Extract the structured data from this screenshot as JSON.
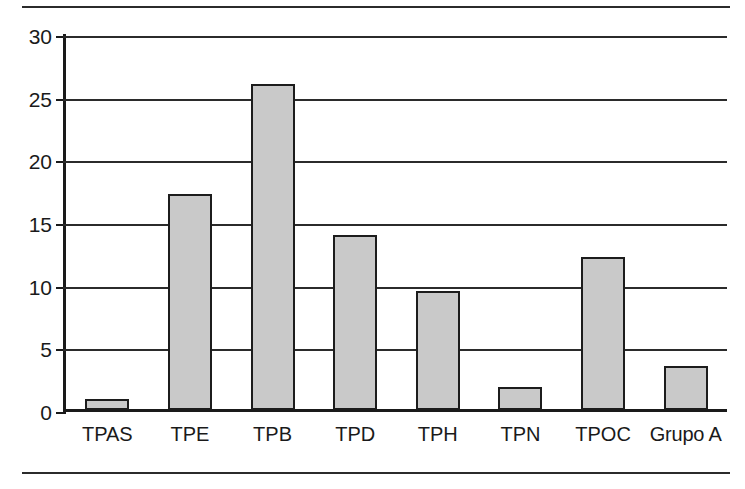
{
  "chart_data": {
    "type": "bar",
    "title": "",
    "subtitle": "",
    "xlabel": "",
    "ylabel": "",
    "categories": [
      "TPAS",
      "TPE",
      "TPB",
      "TPD",
      "TPH",
      "TPN",
      "TPOC",
      "Grupo A"
    ],
    "values": [
      0.85,
      17.2,
      26.0,
      14.0,
      9.5,
      1.8,
      12.2,
      3.5
    ],
    "series": [
      {
        "name": "",
        "values": [
          0.85,
          17.2,
          26.0,
          14.0,
          9.5,
          1.8,
          12.2,
          3.5
        ]
      }
    ],
    "ylim": [
      0,
      30
    ],
    "ytick_labels": [
      "0",
      "5",
      "10",
      "15",
      "20",
      "25",
      "30"
    ],
    "ytick_values": [
      0,
      5,
      10,
      15,
      20,
      25,
      30
    ],
    "grid": true,
    "grid_axis": "y",
    "legend": false,
    "legend_position": "none",
    "bar_fill_color": "#c9c9c9",
    "bar_edge_color": "#1c1c1c",
    "axis_color": "#1a1a1a",
    "background_color": "#ffffff"
  },
  "figure": {
    "top_rule": "",
    "bottom_rule": ""
  }
}
